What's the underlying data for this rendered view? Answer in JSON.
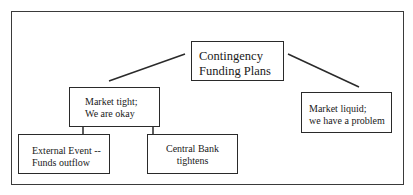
{
  "diagram": {
    "type": "tree",
    "root": {
      "id": "contingency",
      "lines": [
        "Contingency",
        "Funding Plans"
      ]
    },
    "branches": [
      {
        "id": "market-tight",
        "lines": [
          "Market tight;",
          "We are okay"
        ],
        "children": [
          {
            "id": "external-event",
            "lines": [
              "External Event --",
              "Funds outflow"
            ]
          },
          {
            "id": "central-bank",
            "lines": [
              "Central Bank",
              "tightens"
            ]
          }
        ]
      },
      {
        "id": "market-liquid",
        "lines": [
          "Market liquid;",
          "we have a problem"
        ],
        "children": []
      }
    ]
  },
  "colors": {
    "line": "#2a2a2a",
    "frame": "#3a3a3a",
    "background": "#ffffff"
  }
}
